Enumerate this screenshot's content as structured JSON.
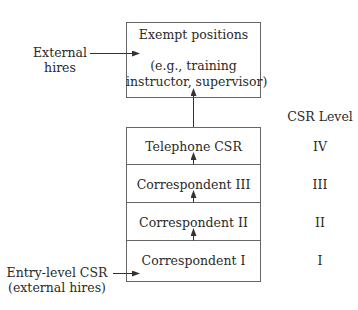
{
  "top_box": {
    "title": "Exempt positions",
    "subtitle_line1": "(e.g., training",
    "subtitle_line2": "instructor, supervisor)"
  },
  "external_hires": {
    "line1": "External",
    "line2": "hires"
  },
  "entry_level": {
    "line1": "Entry-level CSR",
    "line2": "(external hires)"
  },
  "csr_level_header": "CSR Level",
  "ladder": [
    {
      "position": "Telephone CSR",
      "level": "IV"
    },
    {
      "position": "Correspondent III",
      "level": "III"
    },
    {
      "position": "Correspondent II",
      "level": "II"
    },
    {
      "position": "Correspondent I",
      "level": "I"
    }
  ],
  "colors": {
    "line": "#555555",
    "text": "#2a2a2a"
  }
}
